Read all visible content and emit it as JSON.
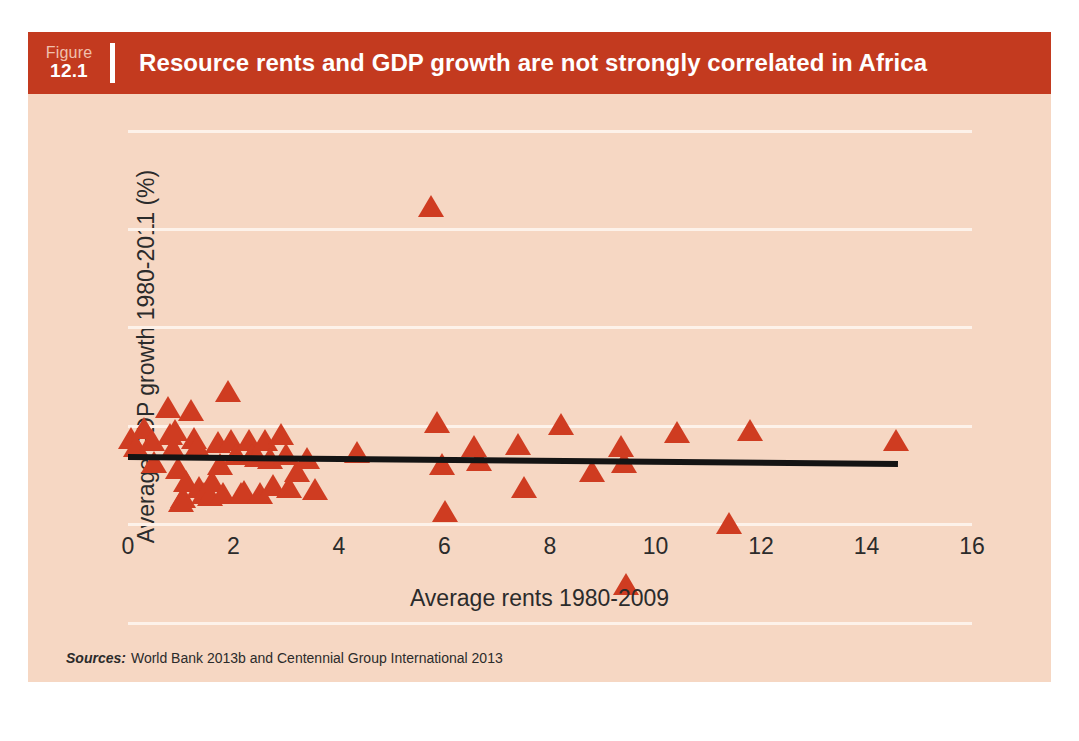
{
  "figure": {
    "number_word": "Figure",
    "number": "12.1",
    "title": "Resource rents and GDP growth are not strongly correlated in Africa",
    "source_word": "Sources:",
    "source_text": "World Bank 2013b and Centennial Group International 2013",
    "header_color": "#c33a1f",
    "panel_color": "#f6d7c3",
    "marker_color": "#cf3c21",
    "grid_color": "#fdf2ea",
    "trend_color": "#141414"
  },
  "chart_data": {
    "type": "scatter",
    "title": "Resource rents and GDP growth are not strongly correlated in Africa",
    "xlabel": "Average rents 1980-2009",
    "ylabel": "Average GDP growth 1980-2011 (%)",
    "xlim": [
      0,
      16
    ],
    "ylim": [
      -5,
      20
    ],
    "xticks": [
      0,
      2,
      4,
      6,
      8,
      10,
      12,
      14,
      16
    ],
    "yticks": [
      -5,
      0,
      5,
      10,
      15,
      20
    ],
    "grid": "horizontal",
    "legend": "none",
    "marker": "triangle-up",
    "series": [
      {
        "name": "African countries",
        "points": [
          [
            0.05,
            4.4
          ],
          [
            0.15,
            4.0
          ],
          [
            0.3,
            4.9
          ],
          [
            0.45,
            4.3
          ],
          [
            0.5,
            3.2
          ],
          [
            0.75,
            6.0
          ],
          [
            0.8,
            4.6
          ],
          [
            0.85,
            3.9
          ],
          [
            0.9,
            4.8
          ],
          [
            0.95,
            2.9
          ],
          [
            1.0,
            1.2
          ],
          [
            1.05,
            1.4
          ],
          [
            1.1,
            2.2
          ],
          [
            1.2,
            5.8
          ],
          [
            1.25,
            4.4
          ],
          [
            1.3,
            4.0
          ],
          [
            1.35,
            1.9
          ],
          [
            1.45,
            1.6
          ],
          [
            1.55,
            1.5
          ],
          [
            1.6,
            2.2
          ],
          [
            1.7,
            4.2
          ],
          [
            1.75,
            3.1
          ],
          [
            1.8,
            1.6
          ],
          [
            1.9,
            6.8
          ],
          [
            1.95,
            4.3
          ],
          [
            2.05,
            3.6
          ],
          [
            2.15,
            1.6
          ],
          [
            2.2,
            1.7
          ],
          [
            2.3,
            4.3
          ],
          [
            2.35,
            3.6
          ],
          [
            2.45,
            3.5
          ],
          [
            2.5,
            1.6
          ],
          [
            2.6,
            4.3
          ],
          [
            2.7,
            3.4
          ],
          [
            2.75,
            2.0
          ],
          [
            2.9,
            4.6
          ],
          [
            3.0,
            3.6
          ],
          [
            3.05,
            1.9
          ],
          [
            3.2,
            2.7
          ],
          [
            3.4,
            3.4
          ],
          [
            3.55,
            1.8
          ],
          [
            4.35,
            3.7
          ],
          [
            5.75,
            16.2
          ],
          [
            5.85,
            5.2
          ],
          [
            5.95,
            3.1
          ],
          [
            6.0,
            0.7
          ],
          [
            6.55,
            4.0
          ],
          [
            6.65,
            3.3
          ],
          [
            7.4,
            4.1
          ],
          [
            7.5,
            1.9
          ],
          [
            8.2,
            5.1
          ],
          [
            8.8,
            2.7
          ],
          [
            9.35,
            4.0
          ],
          [
            9.4,
            3.2
          ],
          [
            9.45,
            -3.0
          ],
          [
            10.4,
            4.7
          ],
          [
            11.4,
            0.1
          ],
          [
            11.8,
            4.8
          ],
          [
            14.55,
            4.3
          ]
        ]
      }
    ],
    "trendline": {
      "x_start": 0.0,
      "y_start": 3.6,
      "x_end": 14.6,
      "y_end": 3.25,
      "description": "near-flat slightly negative fitted line"
    }
  }
}
